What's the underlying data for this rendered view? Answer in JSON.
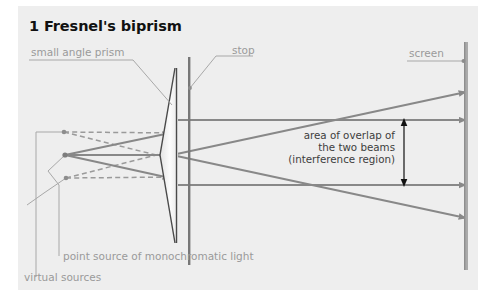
{
  "figure": {
    "title": "1 Fresnel's biprism",
    "domain_kind": "optics-ray-diagram"
  },
  "labels": {
    "prism": "small angle prism",
    "stop": "stop",
    "screen": "screen",
    "point_source": "point source of monochromatic light",
    "virtual_sources": "virtual sources",
    "overlap_line1": "area of overlap of",
    "overlap_line2": "the two beams",
    "overlap_line3": "(interference region)"
  },
  "colors": {
    "panel_background": "#eeeeee",
    "page_background": "#ffffff",
    "title_text": "#111111",
    "label_gray": "#9a9a9a",
    "label_dark": "#3d3d3d",
    "ray_gray": "#888888",
    "prism_outline": "#4a4a4a",
    "stop_bar": "#777777",
    "screen_bar": "#aaaaaa",
    "dimension_arrow": "#111111",
    "virtual_ray_dash": "#9a9a9a"
  },
  "geometry": {
    "point_source": {
      "x": 65,
      "y": 155
    },
    "virtual_source_upper": {
      "x": 64,
      "y": 132
    },
    "virtual_source_lower": {
      "x": 66,
      "y": 178
    },
    "stop_bar_x": 189,
    "screen_bar_x": 466,
    "prism_apex_top_y": 68,
    "prism_apex_bottom_y": 243,
    "overlap_span_top_y": 120,
    "overlap_span_bottom_y": 185
  }
}
